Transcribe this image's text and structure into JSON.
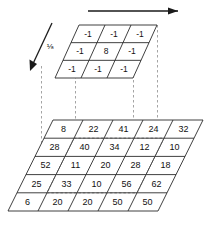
{
  "figure": {
    "kernel": {
      "name": "laplacian-sharpening-kernel",
      "scale_label": "⅛",
      "rows": 3,
      "cols": 3,
      "values": [
        [
          "-1",
          "-1",
          "-1"
        ],
        [
          "-1",
          "8",
          "-1"
        ],
        [
          "-1",
          "-1",
          "-1"
        ]
      ]
    },
    "image_grid": {
      "name": "pixel-value-grid",
      "rows": 5,
      "cols": 5,
      "values": [
        [
          "8",
          "22",
          "41",
          "24",
          "32"
        ],
        [
          "28",
          "40",
          "34",
          "12",
          "10"
        ],
        [
          "52",
          "11",
          "20",
          "28",
          "18"
        ],
        [
          "25",
          "33",
          "10",
          "56",
          "62"
        ],
        [
          "6",
          "20",
          "20",
          "50",
          "50"
        ]
      ],
      "highlight": {
        "name": "kernel-footprint-highlight",
        "start_row": 1,
        "start_col": 1,
        "rows": 3,
        "cols": 3
      }
    },
    "arrows": [
      {
        "name": "column-direction-arrow",
        "direction": "right",
        "label": ""
      },
      {
        "name": "row-direction-arrow",
        "direction": "down-left",
        "label": "⅛"
      }
    ],
    "colors": {
      "stroke": "#2b2b2b",
      "projection": "#9a9a9a",
      "highlight": "#555555",
      "arrow": "#1a1a1a",
      "text": "#111111",
      "background": "#ffffff"
    }
  }
}
